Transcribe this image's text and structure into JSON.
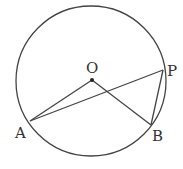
{
  "diagram": {
    "type": "circle-geometry",
    "colors": {
      "stroke": "#444444",
      "label": "#333333",
      "background": "#ffffff"
    },
    "circle": {
      "cx": 91,
      "cy": 81,
      "r": 75
    },
    "points": {
      "O": {
        "label": "O",
        "x": 92,
        "y": 80,
        "label_x": 86,
        "label_y": 73
      },
      "P": {
        "label": "P",
        "x": 163,
        "y": 70,
        "label_x": 167,
        "label_y": 76
      },
      "A": {
        "label": "A",
        "x": 30,
        "y": 121,
        "label_x": 15,
        "label_y": 138
      },
      "B": {
        "label": "B",
        "x": 151,
        "y": 125,
        "label_x": 152,
        "label_y": 141
      }
    },
    "segments": [
      {
        "from": "O",
        "to": "A"
      },
      {
        "from": "O",
        "to": "B"
      },
      {
        "from": "A",
        "to": "P"
      },
      {
        "from": "P",
        "to": "B"
      }
    ]
  }
}
